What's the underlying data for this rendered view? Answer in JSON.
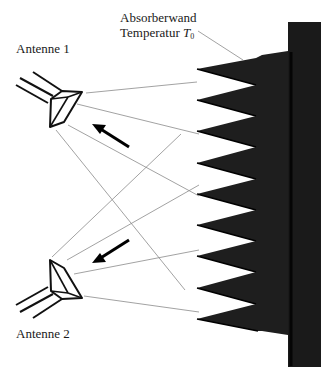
{
  "labels": {
    "wall_line1": "Absorberwand",
    "wall_line2_prefix": "Temperatur ",
    "wall_temp_symbol": "T",
    "wall_temp_subscript": "0",
    "antenna1": "Antenne 1",
    "antenna2": "Antenne 2"
  },
  "colors": {
    "absorber": "#1c1c1c",
    "wall": "#141414",
    "rays": "#8a8a8a",
    "outline": "#111111"
  },
  "absorber": {
    "tooth_count": 9,
    "tip_x": 197,
    "valley_x": 256,
    "tip_y": [
      69,
      100,
      131,
      163,
      194,
      225,
      256,
      288,
      319
    ]
  },
  "arrows": [
    {
      "name": "arrow-toward-antenna-1",
      "direction": "up-left"
    },
    {
      "name": "arrow-toward-antenna-2",
      "direction": "down-left"
    }
  ]
}
